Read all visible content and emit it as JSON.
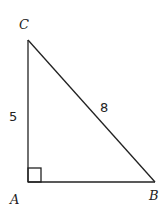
{
  "diagram": {
    "type": "right-triangle",
    "vertices": {
      "A": {
        "label": "A",
        "right_angle": true
      },
      "B": {
        "label": "B"
      },
      "C": {
        "label": "C"
      }
    },
    "sides": {
      "AC": {
        "label": "5"
      },
      "BC": {
        "label": "8"
      },
      "AB": {
        "label": ""
      }
    },
    "colors": {
      "stroke": "#222222",
      "background": "#ffffff"
    }
  }
}
